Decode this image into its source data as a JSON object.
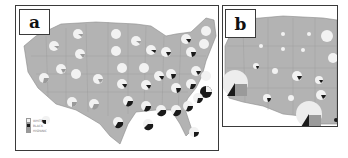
{
  "figure": {
    "panels": [
      {
        "id": "a",
        "label": "a",
        "description": "Contiguous US map with per-state pie charts"
      },
      {
        "id": "b",
        "label": "b",
        "description": "Western/central US map with scaled pie charts"
      }
    ]
  },
  "legend": {
    "items": [
      {
        "label": "WHITE",
        "color": "#f2f2f2"
      },
      {
        "label": "BLACK",
        "color": "#1a1a1a"
      },
      {
        "label": "HISPANIC",
        "color": "#9a9a9a"
      }
    ]
  },
  "colors": {
    "map_fill": "#b3b3b3",
    "state_border": "#8c8c8c",
    "pie_white": "#f2f2f2",
    "pie_black": "#1a1a1a",
    "pie_hispanic": "#9a9a9a",
    "frame": "#3a3a3a"
  }
}
